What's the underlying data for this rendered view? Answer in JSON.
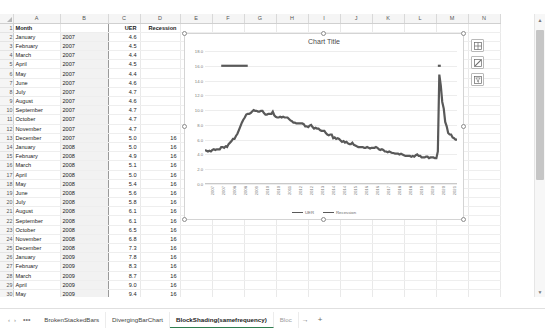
{
  "sheet": {
    "column_headers": [
      "A",
      "B",
      "C",
      "D",
      "E",
      "F",
      "G",
      "H",
      "I",
      "J",
      "K",
      "L",
      "M",
      "N"
    ],
    "header_row": {
      "a": "Month",
      "b": "",
      "c": "UER",
      "d": "Recession"
    },
    "rows": [
      {
        "n": "1",
        "month": "Month",
        "year": "",
        "uer": "UER",
        "rec": "Recession"
      },
      {
        "n": "2",
        "month": "January",
        "year": "2007",
        "uer": "4.6",
        "rec": ""
      },
      {
        "n": "3",
        "month": "February",
        "year": "2007",
        "uer": "4.5",
        "rec": ""
      },
      {
        "n": "4",
        "month": "March",
        "year": "2007",
        "uer": "4.4",
        "rec": ""
      },
      {
        "n": "5",
        "month": "April",
        "year": "2007",
        "uer": "4.5",
        "rec": ""
      },
      {
        "n": "6",
        "month": "May",
        "year": "2007",
        "uer": "4.4",
        "rec": ""
      },
      {
        "n": "7",
        "month": "June",
        "year": "2007",
        "uer": "4.6",
        "rec": ""
      },
      {
        "n": "8",
        "month": "July",
        "year": "2007",
        "uer": "4.7",
        "rec": ""
      },
      {
        "n": "9",
        "month": "August",
        "year": "2007",
        "uer": "4.6",
        "rec": ""
      },
      {
        "n": "10",
        "month": "September",
        "year": "2007",
        "uer": "4.7",
        "rec": ""
      },
      {
        "n": "11",
        "month": "October",
        "year": "2007",
        "uer": "4.7",
        "rec": ""
      },
      {
        "n": "12",
        "month": "November",
        "year": "2007",
        "uer": "4.7",
        "rec": ""
      },
      {
        "n": "13",
        "month": "December",
        "year": "2007",
        "uer": "5.0",
        "rec": "16"
      },
      {
        "n": "14",
        "month": "January",
        "year": "2008",
        "uer": "5.0",
        "rec": "16"
      },
      {
        "n": "15",
        "month": "February",
        "year": "2008",
        "uer": "4.9",
        "rec": "16"
      },
      {
        "n": "16",
        "month": "March",
        "year": "2008",
        "uer": "5.1",
        "rec": "16"
      },
      {
        "n": "17",
        "month": "April",
        "year": "2008",
        "uer": "5.0",
        "rec": "16"
      },
      {
        "n": "18",
        "month": "May",
        "year": "2008",
        "uer": "5.4",
        "rec": "16"
      },
      {
        "n": "19",
        "month": "June",
        "year": "2008",
        "uer": "5.6",
        "rec": "16"
      },
      {
        "n": "20",
        "month": "July",
        "year": "2008",
        "uer": "5.8",
        "rec": "16"
      },
      {
        "n": "21",
        "month": "August",
        "year": "2008",
        "uer": "6.1",
        "rec": "16"
      },
      {
        "n": "22",
        "month": "September",
        "year": "2008",
        "uer": "6.1",
        "rec": "16"
      },
      {
        "n": "23",
        "month": "October",
        "year": "2008",
        "uer": "6.5",
        "rec": "16"
      },
      {
        "n": "24",
        "month": "November",
        "year": "2008",
        "uer": "6.8",
        "rec": "16"
      },
      {
        "n": "25",
        "month": "December",
        "year": "2008",
        "uer": "7.3",
        "rec": "16"
      },
      {
        "n": "26",
        "month": "January",
        "year": "2009",
        "uer": "7.8",
        "rec": "16"
      },
      {
        "n": "27",
        "month": "February",
        "year": "2009",
        "uer": "8.3",
        "rec": "16"
      },
      {
        "n": "28",
        "month": "March",
        "year": "2009",
        "uer": "8.7",
        "rec": "16"
      },
      {
        "n": "29",
        "month": "April",
        "year": "2009",
        "uer": "9.0",
        "rec": "16"
      },
      {
        "n": "30",
        "month": "May",
        "year": "2009",
        "uer": "9.4",
        "rec": "16"
      },
      {
        "n": "31",
        "month": "June",
        "year": "2009",
        "uer": "9.5",
        "rec": "16"
      },
      {
        "n": "32",
        "month": "July",
        "year": "2009",
        "uer": "9.5",
        "rec": ""
      }
    ]
  },
  "chart_buttons": [
    {
      "name": "chart-elements",
      "glyph": "grid"
    },
    {
      "name": "chart-styles",
      "glyph": "brush"
    },
    {
      "name": "chart-filters",
      "glyph": "funnel"
    }
  ],
  "scrollbars": {
    "up_arrow": "▲",
    "down_arrow": "▼",
    "left_arrow": "◀"
  },
  "tabbar": {
    "nav_prev": "‹",
    "nav_next": "›",
    "nav_more": "•••",
    "tabs": [
      {
        "label": "BrokenStackedBars",
        "active": false
      },
      {
        "label": "DivergingBarChart",
        "active": false
      },
      {
        "label": "BlockShading(samefrequency)",
        "active": true
      },
      {
        "label": "Bloc",
        "active": false
      }
    ],
    "overflow": "→",
    "add_sheet": "+"
  },
  "chart_data": {
    "type": "line",
    "title": "Chart Title",
    "xlabel": "",
    "ylabel": "",
    "ylim": [
      0,
      18
    ],
    "yticks": [
      "0.0",
      "2.0",
      "4.0",
      "6.0",
      "8.0",
      "10.0",
      "12.0",
      "14.0",
      "16.0",
      "18.0"
    ],
    "grid": true,
    "legend_position": "bottom",
    "xticks": [
      "2007",
      "2007",
      "2008",
      "2008",
      "2009",
      "2010",
      "2010",
      "2011",
      "2012",
      "2012",
      "2013",
      "2014",
      "2014",
      "2015",
      "2016",
      "2016",
      "2017",
      "2018",
      "2018",
      "2019",
      "2020",
      "2020",
      "2021"
    ],
    "series": [
      {
        "name": "UER",
        "color": "#595959",
        "values": [
          4.6,
          4.5,
          4.4,
          4.5,
          4.4,
          4.6,
          4.7,
          4.6,
          4.7,
          4.7,
          4.7,
          5.0,
          5.0,
          4.9,
          5.1,
          5.0,
          5.4,
          5.6,
          5.8,
          6.1,
          6.1,
          6.5,
          6.8,
          7.3,
          7.8,
          8.3,
          8.7,
          9.0,
          9.4,
          9.5,
          9.5,
          9.6,
          9.8,
          10.0,
          9.9,
          9.9,
          9.8,
          9.8,
          9.9,
          9.9,
          9.6,
          9.4,
          9.4,
          9.5,
          9.5,
          9.5,
          9.8,
          9.3,
          9.1,
          9.0,
          9.0,
          9.1,
          9.0,
          9.1,
          9.0,
          9.0,
          9.0,
          8.8,
          8.6,
          8.5,
          8.3,
          8.3,
          8.2,
          8.2,
          8.2,
          8.2,
          8.2,
          8.1,
          7.8,
          7.8,
          7.7,
          7.9,
          8.0,
          7.7,
          7.5,
          7.6,
          7.5,
          7.5,
          7.3,
          7.2,
          7.2,
          7.2,
          6.9,
          6.7,
          6.6,
          6.7,
          6.7,
          6.2,
          6.3,
          6.1,
          6.2,
          6.1,
          5.9,
          5.7,
          5.8,
          5.6,
          5.7,
          5.5,
          5.4,
          5.4,
          5.6,
          5.3,
          5.2,
          5.1,
          5.0,
          5.0,
          5.0,
          5.0,
          4.9,
          4.9,
          5.0,
          4.9,
          4.8,
          4.9,
          4.9,
          4.9,
          5.0,
          4.9,
          4.7,
          4.6,
          4.7,
          4.6,
          4.4,
          4.4,
          4.3,
          4.4,
          4.3,
          4.2,
          4.2,
          4.1,
          4.1,
          4.1,
          4.0,
          4.1,
          4.0,
          3.9,
          3.8,
          3.8,
          3.8,
          3.8,
          3.7,
          3.8,
          3.7,
          3.9,
          4.0,
          3.8,
          3.8,
          3.6,
          3.6,
          3.6,
          3.7,
          3.7,
          3.5,
          3.6,
          3.6,
          3.6,
          3.5,
          3.5,
          4.4,
          14.8,
          13.3,
          11.1,
          10.2,
          8.4,
          7.8,
          6.9,
          6.7,
          6.7,
          6.3,
          6.2,
          6.0,
          6.0
        ]
      },
      {
        "name": "Recession",
        "color": "#595959",
        "description": "Recession indicator plotted as flat segments at value 16",
        "value": 16,
        "segments": [
          {
            "start_index": 11,
            "end_index": 29
          },
          {
            "start_index": 158,
            "end_index": 160
          }
        ]
      }
    ]
  }
}
